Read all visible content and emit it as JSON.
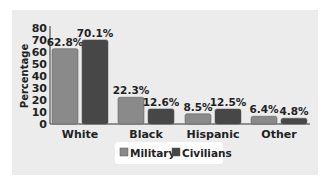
{
  "colors": {
    "military": "#8a8a8a",
    "civilians": "#474747",
    "panel": "#ececec",
    "legend_bg": "#ffffff"
  },
  "chart_data": {
    "type": "bar",
    "title": "",
    "xlabel": "",
    "ylabel": "Percentage",
    "ylim": [
      0,
      80
    ],
    "yticks": [
      0,
      10,
      20,
      30,
      40,
      50,
      60,
      70,
      80
    ],
    "categories": [
      "White",
      "Black",
      "Hispanic",
      "Other"
    ],
    "series": [
      {
        "name": "Military",
        "values": [
          62.8,
          22.3,
          8.5,
          6.4
        ],
        "labels": [
          "62.8%",
          "22.3%",
          "8.5%",
          "6.4%"
        ]
      },
      {
        "name": "Civilians",
        "values": [
          70.1,
          12.6,
          12.5,
          4.8
        ],
        "labels": [
          "70.1%",
          "12.6%",
          "12.5%",
          "4.8%"
        ]
      }
    ],
    "legend_position": "bottom",
    "grid": false
  }
}
